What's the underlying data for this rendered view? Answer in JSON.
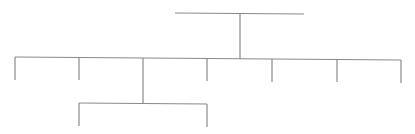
{
  "diagram": {
    "type": "tree-connectors",
    "stroke_color": "#8a8a8a",
    "background": "#ffffff",
    "root_bar": {
      "x1": 175,
      "y1": 13,
      "x2": 304,
      "y2": 14
    },
    "root_stem": {
      "x": 240,
      "y1": 14,
      "y2": 59
    },
    "level1_bar": {
      "x1": 15,
      "y1": 57,
      "x2": 401,
      "y2": 60
    },
    "level1_drops": [
      {
        "x": 15,
        "y1": 57,
        "y2": 80
      },
      {
        "x": 79,
        "y1": 58,
        "y2": 80
      },
      {
        "x": 207,
        "y1": 58,
        "y2": 81
      },
      {
        "x": 272,
        "y1": 59,
        "y2": 82
      },
      {
        "x": 337,
        "y1": 59,
        "y2": 82
      },
      {
        "x": 401,
        "y1": 60,
        "y2": 83
      }
    ],
    "level1_stem_to_level2": {
      "x": 143,
      "y1": 58,
      "y2": 103
    },
    "level2_bar": {
      "x1": 79,
      "y1": 103,
      "x2": 207,
      "y2": 104
    },
    "level2_drops": [
      {
        "x": 79,
        "y1": 103,
        "y2": 126
      },
      {
        "x": 207,
        "y1": 104,
        "y2": 127
      }
    ]
  }
}
